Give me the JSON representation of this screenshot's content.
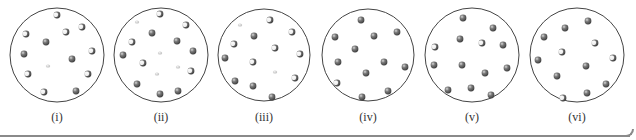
{
  "figure": {
    "colors": {
      "outline": "#444444",
      "solid": "#6b6b6b",
      "highlight": "#ffffff",
      "faint": "#c8c8c8",
      "baseline": "#8a8a8a"
    },
    "panels": [
      {
        "label": "(i)",
        "cx": 57,
        "cy": 55,
        "r": 47,
        "particles": [
          {
            "x": 57,
            "y": 15,
            "t": "mixed"
          },
          {
            "x": 66,
            "y": 32,
            "t": "mixed"
          },
          {
            "x": 82,
            "y": 27,
            "t": "mixed"
          },
          {
            "x": 26,
            "y": 34,
            "t": "mixed"
          },
          {
            "x": 46,
            "y": 42,
            "t": "solid"
          },
          {
            "x": 24,
            "y": 54,
            "t": "solid"
          },
          {
            "x": 72,
            "y": 59,
            "t": "solid"
          },
          {
            "x": 92,
            "y": 51,
            "t": "mixed"
          },
          {
            "x": 48,
            "y": 66,
            "t": "faint"
          },
          {
            "x": 28,
            "y": 74,
            "t": "mixed"
          },
          {
            "x": 88,
            "y": 74,
            "t": "mixed"
          },
          {
            "x": 44,
            "y": 92,
            "t": "mixed"
          },
          {
            "x": 76,
            "y": 91,
            "t": "solid"
          }
        ]
      },
      {
        "label": "(ii)",
        "cx": 161,
        "cy": 55,
        "r": 47,
        "particles": [
          {
            "x": 160,
            "y": 14,
            "t": "mixed"
          },
          {
            "x": 137,
            "y": 22,
            "t": "faint"
          },
          {
            "x": 186,
            "y": 25,
            "t": "mixed"
          },
          {
            "x": 152,
            "y": 33,
            "t": "solid"
          },
          {
            "x": 132,
            "y": 42,
            "t": "mixed"
          },
          {
            "x": 177,
            "y": 41,
            "t": "solid"
          },
          {
            "x": 123,
            "y": 55,
            "t": "solid"
          },
          {
            "x": 160,
            "y": 53,
            "t": "faint"
          },
          {
            "x": 193,
            "y": 51,
            "t": "solid"
          },
          {
            "x": 143,
            "y": 63,
            "t": "mixed"
          },
          {
            "x": 178,
            "y": 67,
            "t": "faint"
          },
          {
            "x": 191,
            "y": 71,
            "t": "mixed"
          },
          {
            "x": 157,
            "y": 74,
            "t": "faint"
          },
          {
            "x": 137,
            "y": 84,
            "t": "solid"
          },
          {
            "x": 160,
            "y": 94,
            "t": "solid"
          },
          {
            "x": 178,
            "y": 91,
            "t": "solid"
          }
        ]
      },
      {
        "label": "(iii)",
        "cx": 264,
        "cy": 55,
        "r": 46,
        "particles": [
          {
            "x": 270,
            "y": 20,
            "t": "mixed"
          },
          {
            "x": 240,
            "y": 25,
            "t": "faint"
          },
          {
            "x": 292,
            "y": 32,
            "t": "mixed"
          },
          {
            "x": 254,
            "y": 36,
            "t": "solid"
          },
          {
            "x": 234,
            "y": 44,
            "t": "mixed"
          },
          {
            "x": 275,
            "y": 48,
            "t": "mixed"
          },
          {
            "x": 300,
            "y": 54,
            "t": "mixed"
          },
          {
            "x": 225,
            "y": 58,
            "t": "solid"
          },
          {
            "x": 253,
            "y": 62,
            "t": "mixed"
          },
          {
            "x": 275,
            "y": 72,
            "t": "faint"
          },
          {
            "x": 295,
            "y": 78,
            "t": "mixed"
          },
          {
            "x": 235,
            "y": 81,
            "t": "solid"
          },
          {
            "x": 253,
            "y": 86,
            "t": "solid"
          },
          {
            "x": 272,
            "y": 97,
            "t": "solid"
          }
        ]
      },
      {
        "label": "(iv)",
        "cx": 368,
        "cy": 55,
        "r": 46,
        "particles": [
          {
            "x": 361,
            "y": 20,
            "t": "solid"
          },
          {
            "x": 335,
            "y": 37,
            "t": "solid"
          },
          {
            "x": 374,
            "y": 36,
            "t": "solid"
          },
          {
            "x": 397,
            "y": 32,
            "t": "solid"
          },
          {
            "x": 355,
            "y": 49,
            "t": "solid"
          },
          {
            "x": 338,
            "y": 62,
            "t": "solid"
          },
          {
            "x": 384,
            "y": 62,
            "t": "solid"
          },
          {
            "x": 405,
            "y": 67,
            "t": "solid"
          },
          {
            "x": 366,
            "y": 73,
            "t": "solid"
          },
          {
            "x": 337,
            "y": 83,
            "t": "mixed"
          },
          {
            "x": 388,
            "y": 91,
            "t": "solid"
          },
          {
            "x": 362,
            "y": 97,
            "t": "solid"
          }
        ]
      },
      {
        "label": "(v)",
        "cx": 472,
        "cy": 55,
        "r": 47,
        "particles": [
          {
            "x": 463,
            "y": 18,
            "t": "solid"
          },
          {
            "x": 493,
            "y": 28,
            "t": "solid"
          },
          {
            "x": 460,
            "y": 39,
            "t": "solid"
          },
          {
            "x": 482,
            "y": 43,
            "t": "mixed"
          },
          {
            "x": 435,
            "y": 47,
            "t": "mixed"
          },
          {
            "x": 503,
            "y": 45,
            "t": "solid"
          },
          {
            "x": 434,
            "y": 65,
            "t": "solid"
          },
          {
            "x": 462,
            "y": 65,
            "t": "solid"
          },
          {
            "x": 507,
            "y": 68,
            "t": "solid"
          },
          {
            "x": 485,
            "y": 73,
            "t": "solid"
          },
          {
            "x": 448,
            "y": 90,
            "t": "solid"
          },
          {
            "x": 471,
            "y": 88,
            "t": "solid"
          },
          {
            "x": 491,
            "y": 95,
            "t": "solid"
          }
        ]
      },
      {
        "label": "(vi)",
        "cx": 577,
        "cy": 55,
        "r": 47,
        "particles": [
          {
            "x": 588,
            "y": 21,
            "t": "solid"
          },
          {
            "x": 565,
            "y": 28,
            "t": "solid"
          },
          {
            "x": 544,
            "y": 37,
            "t": "solid"
          },
          {
            "x": 595,
            "y": 43,
            "t": "mixed"
          },
          {
            "x": 562,
            "y": 52,
            "t": "mixed"
          },
          {
            "x": 613,
            "y": 58,
            "t": "mixed"
          },
          {
            "x": 538,
            "y": 60,
            "t": "solid"
          },
          {
            "x": 586,
            "y": 66,
            "t": "solid"
          },
          {
            "x": 557,
            "y": 76,
            "t": "solid"
          },
          {
            "x": 606,
            "y": 84,
            "t": "solid"
          },
          {
            "x": 587,
            "y": 93,
            "t": "solid"
          },
          {
            "x": 563,
            "y": 98,
            "t": "mixed"
          }
        ]
      }
    ]
  },
  "labels": {
    "panel_1": "(i)",
    "panel_2": "(ii)",
    "panel_3": "(iii)",
    "panel_4": "(iv)",
    "panel_5": "(v)",
    "panel_6": "(vi)"
  }
}
